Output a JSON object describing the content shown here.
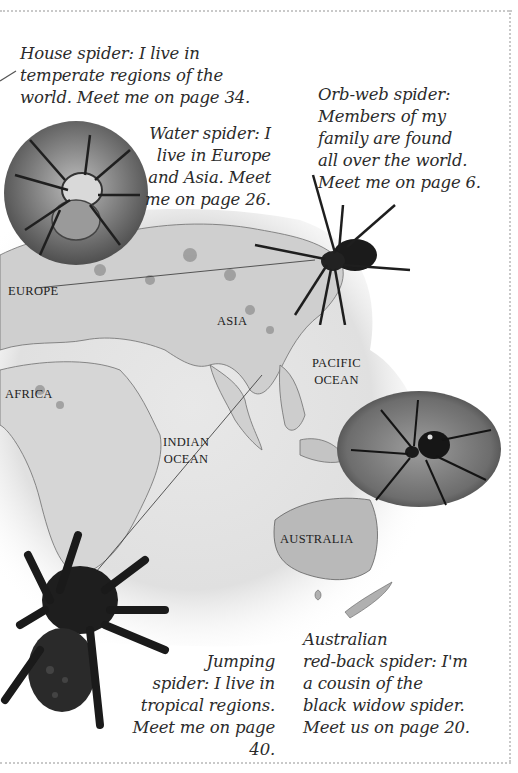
{
  "captions": {
    "house_spider": "House spider: I live in\ntemperate regions of the\nworld. Meet me on page 34.",
    "water_spider": "Water spider: I\nlive in Europe\nand Asia. Meet\nme on page 26.",
    "orb_web_spider": "Orb-web spider:\nMembers of my\nfamily are found\nall over the world.\nMeet me on page 6.",
    "jumping_spider": "Jumping\nspider: I live in\ntropical regions.\nMeet me on page 40.",
    "red_back_spider": "Australian\nred-back spider: I'm\na cousin of the\nblack widow spider.\nMeet us on page 20."
  },
  "map_labels": {
    "europe": "EUROPE",
    "asia": "ASIA",
    "africa": "AFRICA",
    "pacific_ocean": "PACIFIC\nOCEAN",
    "indian_ocean": "INDIAN\nOCEAN",
    "australia": "AUSTRALIA"
  },
  "colors": {
    "text": "#2b2b2b",
    "map_land": "#a9a9a9",
    "map_wash": "#e4e4e4",
    "border_dots": "#c9c9c9"
  }
}
